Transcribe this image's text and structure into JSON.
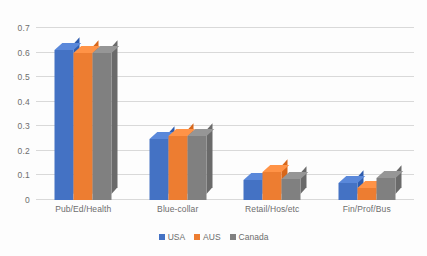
{
  "chart_data": {
    "type": "bar",
    "title": "",
    "subtitle": "",
    "xlabel": "",
    "ylabel": "",
    "categories": [
      "Pub/Ed/Health",
      "Blue-collar",
      "Retail/Hos/etc",
      "Fin/Prof/Bus"
    ],
    "series": [
      {
        "name": "USA",
        "color": "#4472C4",
        "values": [
          0.61,
          0.25,
          0.08,
          0.07
        ]
      },
      {
        "name": "AUS",
        "color": "#ED7D31",
        "values": [
          0.6,
          0.26,
          0.115,
          0.05
        ]
      },
      {
        "name": "Canada",
        "color": "#808080",
        "values": [
          0.6,
          0.26,
          0.085,
          0.09
        ]
      }
    ],
    "ylim": [
      0,
      0.7
    ],
    "ytick_labels": [
      "0",
      "0.1",
      "0.2",
      "0.3",
      "0.4",
      "0.5",
      "0.6",
      "0.7"
    ],
    "ytick_values": [
      0,
      0.1,
      0.2,
      0.3,
      0.4,
      0.5,
      0.6,
      0.7
    ],
    "grid": true,
    "legend_position": "bottom",
    "style": "3d-clustered-column",
    "gridline_color": "#d9d9d9",
    "text_color": "#6d6d6d",
    "background_color": "#ffffff"
  }
}
